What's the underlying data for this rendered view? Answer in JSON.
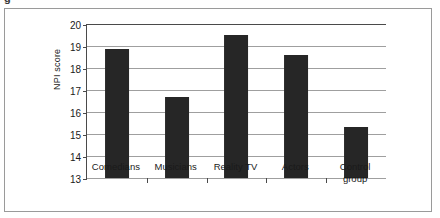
{
  "figure": {
    "artifact_text": "g",
    "background_color": "#ffffff",
    "frame_color": "#9a9a9a"
  },
  "chart_data": {
    "type": "bar",
    "title": "",
    "xlabel": "",
    "ylabel": "NPI score",
    "categories": [
      "Comedians",
      "Musicians",
      "Reality TV",
      "Actors",
      "Control group"
    ],
    "category_lines": [
      [
        "Comedians"
      ],
      [
        "Musicians"
      ],
      [
        "Reality TV"
      ],
      [
        "Actors"
      ],
      [
        "Control",
        "group"
      ]
    ],
    "values": [
      18.85,
      16.7,
      19.5,
      18.6,
      15.3
    ],
    "ylim": [
      13,
      20
    ],
    "yticks": [
      20,
      19,
      18,
      17,
      16,
      15,
      14,
      13
    ],
    "grid": true,
    "legend": "none",
    "bar_color": "#262626",
    "axis_color": "#4a4a4a",
    "gridline_color": "#9f9f9f"
  }
}
